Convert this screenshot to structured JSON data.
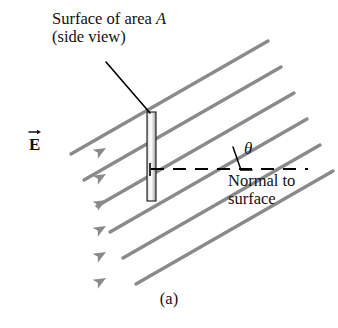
{
  "figure": {
    "part_label": "(a)",
    "labels": {
      "surface_line1_pre": "Surface of area ",
      "surface_line1_sym": "A",
      "surface_line2": "(side view)",
      "normal_line1": "Normal to",
      "normal_line2": "surface",
      "efield_symbol": "E",
      "angle_symbol": "θ"
    }
  },
  "diagram_data": {
    "type": "physics-vector-diagram",
    "subject": "Electric flux through a flat surface",
    "colors": {
      "field_line": "#8a8a8a",
      "plate_edge": "#2b2b2b",
      "plate_fill_light": "#f2f2f2",
      "plate_fill_mid": "#bdbdbd",
      "normal_dash": "#000000",
      "leader": "#000000",
      "text": "#111111",
      "background": "#ffffff"
    },
    "field": {
      "count": 6,
      "slope_deg": 30,
      "direction": "up-and-to-the-right",
      "arrowheads": 6,
      "label": "E"
    },
    "surface": {
      "orientation": "vertical (side view)",
      "x": 151,
      "y_top": 112,
      "y_bottom": 200,
      "thickness_px": 9,
      "area_symbol": "A"
    },
    "normal": {
      "style": "dashed",
      "direction": "horizontal",
      "y": 169,
      "x_start": 151,
      "x_end": 308
    },
    "angle": {
      "symbol": "θ",
      "between": [
        "field line",
        "normal to surface"
      ],
      "value_deg": 30,
      "vertex_x": 236,
      "vertex_y": 169
    },
    "leader": {
      "from_x": 106,
      "from_y": 62,
      "to_x": 150,
      "to_y": 113
    }
  }
}
